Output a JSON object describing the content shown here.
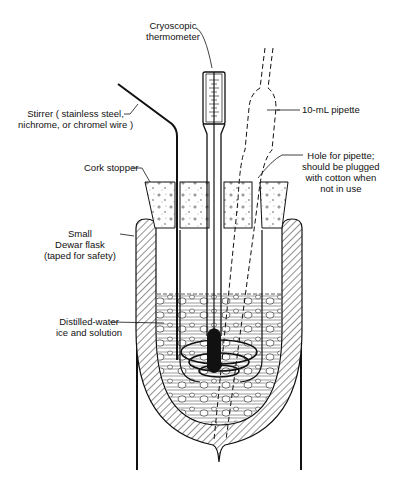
{
  "diagram": {
    "colors": {
      "ink": "#111111",
      "background": "#ffffff"
    },
    "labels": {
      "thermometer": {
        "line1": "Cryoscopic",
        "line2": "thermometer"
      },
      "stirrer": {
        "line1": "Stirrer ( stainless steel,",
        "line2": "nichrome, or chromel wire )"
      },
      "pipette": {
        "line1": "10-mL  pipette"
      },
      "cork": {
        "line1": "Cork stopper"
      },
      "hole": {
        "line1": "Hole for pipette;",
        "line2": "should be plugged",
        "line3": "with cotton when",
        "line4": "not in use"
      },
      "dewar": {
        "line1": "Small",
        "line2": "Dewar flask",
        "line3": "(taped for safety)"
      },
      "mixture": {
        "line1": "Distilled-water",
        "line2": "ice and solution"
      }
    }
  }
}
